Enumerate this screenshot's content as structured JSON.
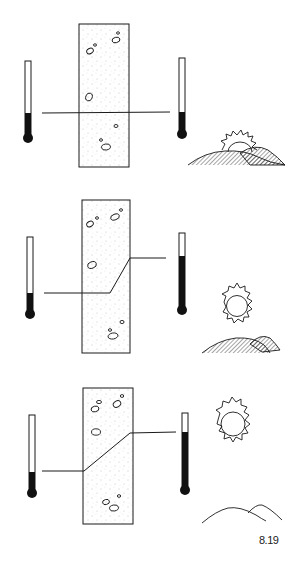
{
  "figure": {
    "label": "8.19",
    "ink_color": "#1a1a1a",
    "background": "#ffffff"
  },
  "panels": [
    {
      "id": "panel-1",
      "scene": "sunrise",
      "slab": {
        "x": 79,
        "y": 24,
        "w": 50,
        "h": 143
      },
      "left_thermometer": {
        "x": 24,
        "top": 61,
        "fill_top": 113,
        "bulb_y": 138
      },
      "right_thermometer": {
        "x": 179,
        "top": 58,
        "fill_top": 112,
        "bulb_y": 134
      },
      "temperature_line": "M42,113 L170,112"
    },
    {
      "id": "panel-2",
      "scene": "mid-morning",
      "slab": {
        "x": 82,
        "y": 200,
        "w": 48,
        "h": 153
      },
      "left_thermometer": {
        "x": 26,
        "top": 237,
        "fill_top": 293,
        "bulb_y": 314
      },
      "right_thermometer": {
        "x": 179,
        "top": 233,
        "fill_top": 256,
        "bulb_y": 310
      },
      "temperature_line": "M44,293 L110,293 L130,258 L166,258"
    },
    {
      "id": "panel-3",
      "scene": "midday",
      "slab": {
        "x": 83,
        "y": 388,
        "w": 50,
        "h": 136
      },
      "left_thermometer": {
        "x": 28,
        "top": 415,
        "fill_top": 472,
        "bulb_y": 493
      },
      "right_thermometer": {
        "x": 181,
        "top": 413,
        "fill_top": 432,
        "bulb_y": 490
      },
      "temperature_line": "M42,471 L84,471 L130,433 L176,432"
    }
  ]
}
